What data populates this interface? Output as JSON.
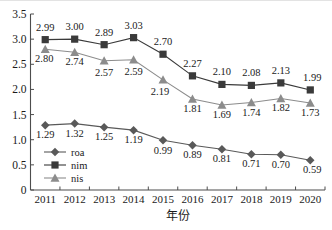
{
  "chart_data": {
    "type": "line",
    "title": "",
    "xlabel": "年份",
    "ylabel": "",
    "categories": [
      "2011",
      "2012",
      "2013",
      "2014",
      "2015",
      "2016",
      "2017",
      "2018",
      "2019",
      "2020"
    ],
    "ylim": [
      0,
      3.5
    ],
    "yticks": [
      "0",
      "0.5",
      "1.0",
      "1.5",
      "2.0",
      "2.5",
      "3.0",
      "3.5"
    ],
    "ytick_values": [
      0,
      0.5,
      1.0,
      1.5,
      2.0,
      2.5,
      3.0,
      3.5
    ],
    "grid": false,
    "legend_position": "lower-left-inside",
    "series": [
      {
        "name": "roa",
        "marker": "diamond",
        "color": "#595959",
        "values": [
          1.29,
          1.32,
          1.25,
          1.19,
          0.99,
          0.89,
          0.81,
          0.71,
          0.7,
          0.59
        ],
        "labels": [
          "1.29",
          "1.32",
          "1.25",
          "1.19",
          "0.99",
          "0.89",
          "0.81",
          "0.71",
          "0.70",
          "0.59"
        ]
      },
      {
        "name": "nim",
        "marker": "square",
        "color": "#3a3a3a",
        "values": [
          2.99,
          3.0,
          2.89,
          3.03,
          2.7,
          2.27,
          2.1,
          2.08,
          2.13,
          1.99
        ],
        "labels": [
          "2.99",
          "3.00",
          "2.89",
          "3.03",
          "2.70",
          "2.27",
          "2.10",
          "2.08",
          "2.13",
          "1.99"
        ]
      },
      {
        "name": "nis",
        "marker": "triangle",
        "color": "#8c8c8c",
        "values": [
          2.8,
          2.74,
          2.57,
          2.59,
          2.19,
          1.81,
          1.69,
          1.74,
          1.82,
          1.73
        ],
        "labels": [
          "2.80",
          "2.74",
          "2.57",
          "2.59",
          "2.19",
          "1.81",
          "1.69",
          "1.74",
          "1.82",
          "1.73"
        ]
      }
    ]
  },
  "axis": {
    "line_color": "#4d4d4d",
    "text_color": "#1a1a1a"
  },
  "legend": {
    "items": [
      {
        "label": "roa",
        "marker": "diamond",
        "color": "#595959"
      },
      {
        "label": "nim",
        "marker": "square",
        "color": "#3a3a3a"
      },
      {
        "label": "nis",
        "marker": "triangle",
        "color": "#8c8c8c"
      }
    ]
  }
}
